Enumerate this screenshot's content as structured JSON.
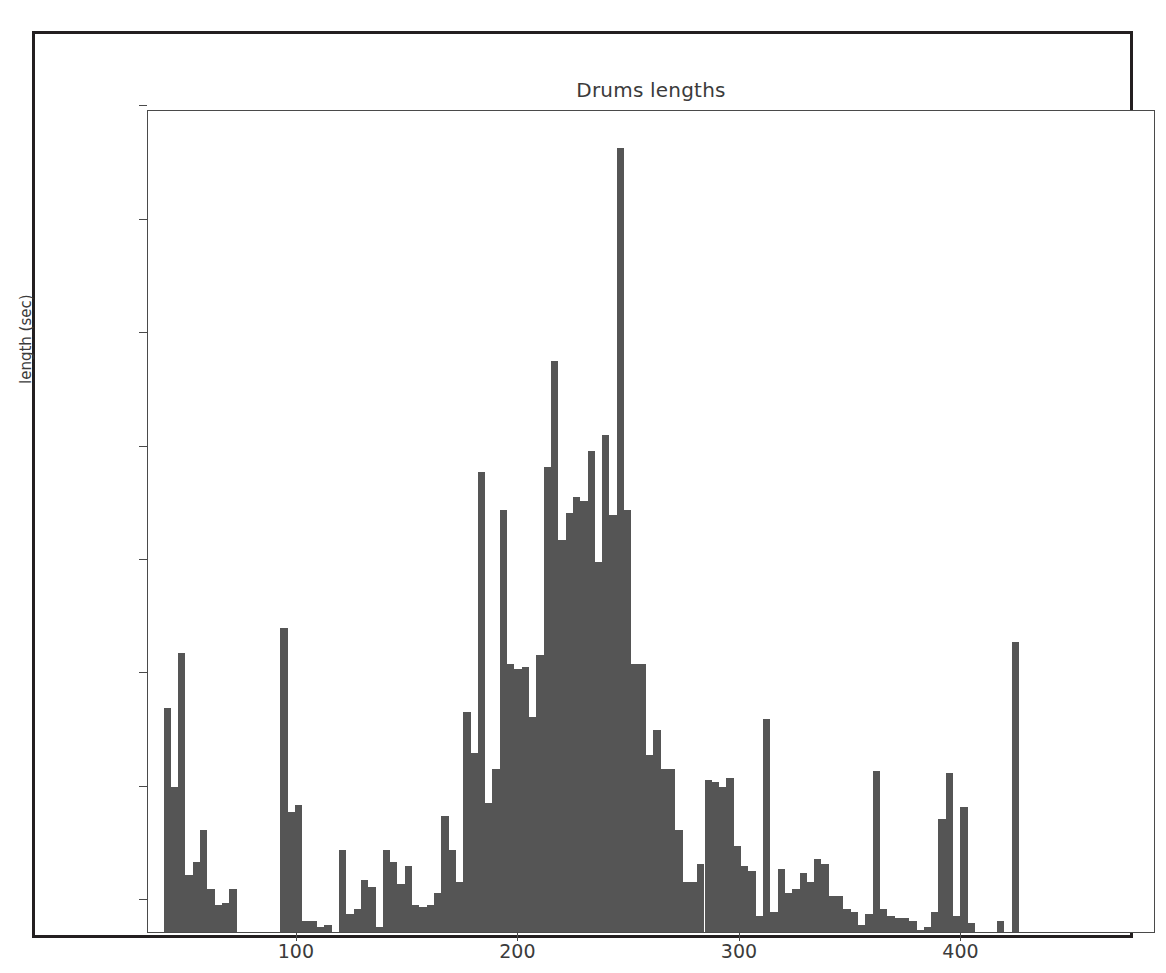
{
  "figure": {
    "title": "Drums lengths",
    "background_color": "#ffffff",
    "border_color": "#231f20"
  },
  "chart_data": {
    "type": "bar",
    "subtype": "histogram",
    "title": "Drums lengths",
    "xlabel": "",
    "ylabel": "length (sec)",
    "bar_color": "#555555",
    "grid": false,
    "legend": null,
    "xlim": [
      17,
      472
    ],
    "ylim": [
      0,
      363
    ],
    "xticks": [
      100,
      200,
      300,
      400
    ],
    "xtick_labels": [
      "100",
      "200",
      "300",
      "400"
    ],
    "yticks": [
      0,
      50,
      100,
      150,
      200,
      250,
      300,
      350
    ],
    "ytick_labels": [
      "0",
      "50",
      "100",
      "150",
      "200",
      "250",
      "300",
      "350"
    ],
    "bin_width": 3.3,
    "bin_starts": [
      24.0,
      27.3,
      30.6,
      33.9,
      37.2,
      40.5,
      43.8,
      47.1,
      50.4,
      53.7,
      57.0,
      60.3,
      63.6,
      66.9,
      70.2,
      73.5,
      76.8,
      80.1,
      83.4,
      86.7,
      90.0,
      93.3,
      96.6,
      99.9,
      103.2,
      106.5,
      109.8,
      113.1,
      116.4,
      119.7,
      123.0,
      126.3,
      129.6,
      132.9,
      136.2,
      139.5,
      142.8,
      146.1,
      149.4,
      152.7,
      156.0,
      159.3,
      162.6,
      165.9,
      169.2,
      172.5,
      175.8,
      179.1,
      182.4,
      185.7,
      189.0,
      192.3,
      195.6,
      198.9,
      202.2,
      205.5,
      208.8,
      212.1,
      215.4,
      218.7,
      222.0,
      225.3,
      228.6,
      231.9,
      235.2,
      238.5,
      241.8,
      245.1,
      248.4,
      251.7,
      255.0,
      258.3,
      261.6,
      264.9,
      268.2,
      271.5,
      274.8,
      278.1,
      281.4,
      284.7,
      288.0,
      291.3,
      294.6,
      297.9,
      301.2,
      304.5,
      307.8,
      311.1,
      314.4,
      317.7,
      321.0,
      324.3,
      327.6,
      330.9,
      334.2,
      337.5,
      340.8,
      344.1,
      347.4,
      350.7,
      354.0,
      357.3,
      360.6,
      363.9,
      367.2,
      370.5,
      373.8,
      377.1,
      380.4,
      383.7,
      387.0,
      390.3,
      393.6,
      396.9,
      400.2,
      403.5,
      406.8,
      410.1,
      413.4,
      416.7,
      420.0,
      423.3,
      426.6,
      429.9,
      433.2,
      436.5,
      439.8,
      443.1,
      446.4,
      449.7,
      453.0,
      456.3,
      459.6
    ],
    "values": [
      99,
      64,
      123,
      25,
      31,
      45,
      19,
      12,
      13,
      19,
      0,
      0,
      0,
      0,
      0,
      0,
      134,
      53,
      56,
      5,
      5,
      2,
      3,
      0,
      36,
      8,
      10,
      23,
      20,
      2,
      36,
      31,
      21,
      29,
      12,
      11,
      12,
      17,
      51,
      36,
      22,
      97,
      79,
      203,
      57,
      72,
      186,
      118,
      116,
      117,
      95,
      122,
      205,
      252,
      173,
      185,
      192,
      190,
      212,
      163,
      219,
      184,
      346,
      186,
      118,
      118,
      78,
      89,
      72,
      72,
      45,
      22,
      22,
      30,
      67,
      66,
      64,
      68,
      38,
      29,
      27,
      7,
      94,
      9,
      28,
      17,
      19,
      26,
      22,
      32,
      30,
      16,
      16,
      10,
      9,
      3,
      8,
      71,
      10,
      7,
      6,
      6,
      5,
      1,
      2,
      9,
      50,
      70,
      7,
      55,
      4,
      0,
      0,
      0,
      5,
      0,
      128
    ],
    "peak": {
      "x": 248,
      "y": 346
    },
    "n_bins": 117
  }
}
